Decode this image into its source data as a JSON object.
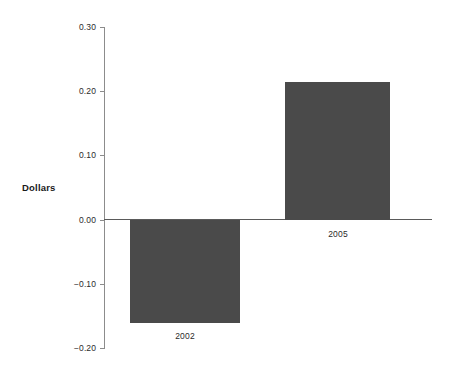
{
  "chart_data": {
    "type": "bar",
    "title": "",
    "subtitle": "",
    "xlabel": "",
    "ylabel": "Dollars",
    "categories": [
      "2002",
      "2005"
    ],
    "values": [
      -0.16,
      0.215
    ],
    "series": [
      {
        "name": "Dollars",
        "values": [
          -0.16,
          0.215
        ]
      }
    ],
    "ylim": [
      -0.2,
      0.3
    ],
    "ytick_values": [
      0.3,
      0.2,
      0.1,
      0.0,
      -0.1,
      -0.2
    ],
    "ytick_labels": [
      "0.30",
      "0.20",
      "0.10",
      "0.00",
      "-0.10",
      "-0.20"
    ],
    "grid": false,
    "legend": false,
    "legend_position": "none",
    "bar_color": "#4a4a4a",
    "axis_color": "#8c8c8c",
    "zero_line_color": "#5a5a5a",
    "background_color": "#ffffff",
    "annotations": []
  },
  "axis": {
    "y_title": "Dollars"
  },
  "ticks": [
    {
      "label": "0.30",
      "value": 0.3
    },
    {
      "label": "0.20",
      "value": 0.2
    },
    {
      "label": "0.10",
      "value": 0.1
    },
    {
      "label": "0.00",
      "value": 0.0
    },
    {
      "label": "-0.10",
      "value": -0.1
    },
    {
      "label": "-0.20",
      "value": -0.2
    }
  ],
  "bars": [
    {
      "label": "2002",
      "value": -0.16
    },
    {
      "label": "2005",
      "value": 0.215
    }
  ]
}
